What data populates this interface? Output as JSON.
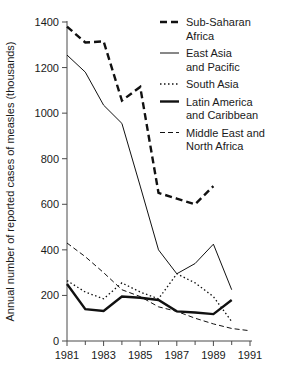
{
  "chart_data": {
    "type": "line",
    "title": "",
    "xlabel": "",
    "ylabel": "Annual number of reported cases of measles (thousands)",
    "x": [
      1981,
      1982,
      1983,
      1984,
      1985,
      1986,
      1987,
      1988,
      1989,
      1990,
      1991
    ],
    "xlim": [
      1981,
      1991
    ],
    "ylim": [
      0,
      1400
    ],
    "ytick_labels": [
      "0",
      "200",
      "400",
      "600",
      "800",
      "1000",
      "1200",
      "1400"
    ],
    "ytick_values": [
      0,
      200,
      400,
      600,
      800,
      1000,
      1200,
      1400
    ],
    "xtick_labels": [
      "1981",
      "1983",
      "1985",
      "1987",
      "1989",
      "1991"
    ],
    "xtick_values": [
      1981,
      1983,
      1985,
      1987,
      1989,
      1991
    ],
    "xminor_values": [
      1982,
      1984,
      1986,
      1988,
      1990
    ],
    "grid": false,
    "legend_position": "top-right",
    "series": [
      {
        "name": "Sub-Saharan Africa",
        "style": "thick-dashed",
        "stroke_width": 2.4,
        "dash": "7,4",
        "x": [
          1981,
          1982,
          1983,
          1984,
          1985,
          1986,
          1987,
          1988,
          1989
        ],
        "values": [
          1380,
          1310,
          1315,
          1055,
          1115,
          650,
          625,
          600,
          680
        ]
      },
      {
        "name": "East Asia and Pacific",
        "style": "thin-solid",
        "stroke_width": 1,
        "dash": "none",
        "x": [
          1981,
          1982,
          1983,
          1984,
          1985,
          1986,
          1987,
          1988,
          1989,
          1990
        ],
        "values": [
          1255,
          1180,
          1035,
          955,
          680,
          400,
          295,
          340,
          425,
          225
        ]
      },
      {
        "name": "South Asia",
        "style": "dotted",
        "stroke_width": 1.3,
        "dash": "1.5,2.5",
        "x": [
          1981,
          1982,
          1983,
          1984,
          1985,
          1986,
          1987,
          1988,
          1989,
          1990
        ],
        "values": [
          265,
          215,
          185,
          255,
          215,
          185,
          295,
          255,
          195,
          85
        ]
      },
      {
        "name": "Latin America and Caribbean",
        "style": "thick-solid",
        "stroke_width": 2.4,
        "dash": "none",
        "x": [
          1981,
          1982,
          1983,
          1984,
          1985,
          1986,
          1987,
          1988,
          1989,
          1990
        ],
        "values": [
          250,
          140,
          132,
          195,
          190,
          180,
          130,
          125,
          118,
          180
        ]
      },
      {
        "name": "Middle East and North Africa",
        "style": "thin-dashed",
        "stroke_width": 1,
        "dash": "5,3",
        "x": [
          1981,
          1982,
          1983,
          1984,
          1985,
          1986,
          1987,
          1988,
          1989,
          1990,
          1991
        ],
        "values": [
          430,
          370,
          300,
          225,
          195,
          150,
          130,
          100,
          75,
          55,
          45
        ]
      }
    ]
  },
  "legend": {
    "entries": [
      {
        "label_line1": "Sub-Saharan",
        "label_line2": "Africa"
      },
      {
        "label_line1": "East Asia",
        "label_line2": "and Pacific"
      },
      {
        "label_line1": "South Asia",
        "label_line2": ""
      },
      {
        "label_line1": "Latin America",
        "label_line2": "and Caribbean"
      },
      {
        "label_line1": "Middle East and",
        "label_line2": "North Africa"
      }
    ]
  }
}
